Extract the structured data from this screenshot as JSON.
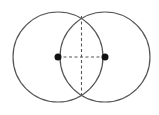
{
  "diagram": {
    "width": 159,
    "height": 115,
    "background": "#ffffff",
    "stroke_color": "#555555",
    "dot_color": "#111111",
    "circles": [
      {
        "id": "left-circle",
        "cx": 58,
        "cy": 57,
        "r": 45
      },
      {
        "id": "right-circle",
        "cx": 105,
        "cy": 57,
        "r": 45
      }
    ],
    "centers": [
      {
        "id": "left-center",
        "x": 58,
        "y": 57,
        "r": 3.5
      },
      {
        "id": "right-center",
        "x": 105,
        "y": 57,
        "r": 3.5
      }
    ],
    "dashed_lines": [
      {
        "id": "center-segment",
        "x1": 58,
        "y1": 57,
        "x2": 105,
        "y2": 57
      },
      {
        "id": "common-chord",
        "x1": 81.5,
        "y1": 16,
        "x2": 81.5,
        "y2": 98
      }
    ],
    "intersection_points": [
      {
        "id": "top-intersection",
        "x": 81.5,
        "y": 16
      },
      {
        "id": "bottom-intersection",
        "x": 81.5,
        "y": 98
      }
    ]
  }
}
